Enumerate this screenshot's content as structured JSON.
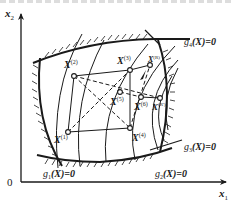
{
  "axes": {
    "x_label": "x",
    "x_sub": "1",
    "y_label": "x",
    "y_sub": "2",
    "origin": "0"
  },
  "constraints": [
    {
      "id": "g1",
      "label": "g",
      "sub": "1",
      "expr": "(X)=0"
    },
    {
      "id": "g2",
      "label": "g",
      "sub": "2",
      "expr": "(X)=0"
    },
    {
      "id": "g3",
      "label": "g",
      "sub": "3",
      "expr": "(X)=0"
    },
    {
      "id": "g4",
      "label": "g",
      "sub": "4",
      "expr": "(X)=0"
    }
  ],
  "points": [
    {
      "id": "X1",
      "label": "X",
      "sup": "(1)"
    },
    {
      "id": "X2",
      "label": "X",
      "sup": "(2)"
    },
    {
      "id": "X3",
      "label": "X",
      "sup": "(3)"
    },
    {
      "id": "X4",
      "label": "X",
      "sup": "(4)"
    },
    {
      "id": "X5",
      "label": "X",
      "sup": "(5)"
    },
    {
      "id": "X6",
      "label": "X",
      "sup": "(6)"
    },
    {
      "id": "XR",
      "label": "X",
      "sup": "(R)"
    },
    {
      "id": "XRp",
      "label": "X",
      "sup": "(R')"
    }
  ],
  "colors": {
    "ink": "#1a1a1a",
    "background": "#ffffff"
  }
}
